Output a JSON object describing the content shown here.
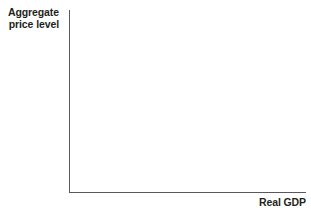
{
  "chart_data": {
    "type": "line",
    "title": "",
    "subtitle": "",
    "xlabel": "Real GDP",
    "ylabel": "Aggregate price level",
    "ylabel_line1": "Aggregate",
    "ylabel_line2": "price level",
    "series": [],
    "categories": [],
    "x": [],
    "values": [],
    "xticks": [],
    "yticks": [],
    "xticklabels": [],
    "yticklabels": [],
    "grid": false,
    "legend": false,
    "legend_position": "none",
    "annotations": [],
    "axis_color": "#58595b",
    "text_color": "#231f20",
    "background_color": "#ffffff"
  },
  "figure": {
    "y_axis_label": "Aggregate\nprice level",
    "x_axis_label": "Real GDP"
  }
}
